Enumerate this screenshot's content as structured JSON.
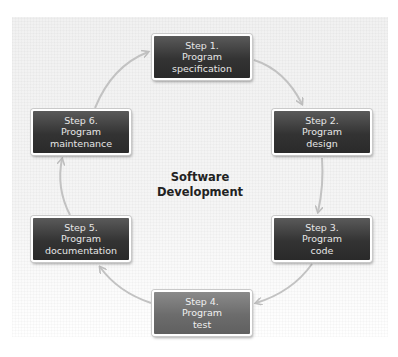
{
  "diagram": {
    "title_line1": "Software",
    "title_line2": "Development",
    "colors": {
      "box_dark": "#333333",
      "box_highlight": "#6c6c6c",
      "box_text": "#e6e6e6",
      "arrow": "#bdbdbd",
      "panel": "#f3f3f3",
      "title_text": "#222222"
    },
    "steps": [
      {
        "step": "Step 1.",
        "line2": "Program",
        "line3": "specification"
      },
      {
        "step": "Step 2.",
        "line2": "Program",
        "line3": "design"
      },
      {
        "step": "Step 3.",
        "line2": "Program",
        "line3": "code"
      },
      {
        "step": "Step 4.",
        "line2": "Program",
        "line3": "test"
      },
      {
        "step": "Step 5.",
        "line2": "Program",
        "line3": "documentation"
      },
      {
        "step": "Step 6.",
        "line2": "Program",
        "line3": "maintenance"
      }
    ],
    "flow": [
      "Step 1 → Step 2",
      "Step 2 → Step 3",
      "Step 3 → Step 4",
      "Step 4 → Step 5",
      "Step 5 → Step 6",
      "Step 6 → Step 1"
    ]
  }
}
